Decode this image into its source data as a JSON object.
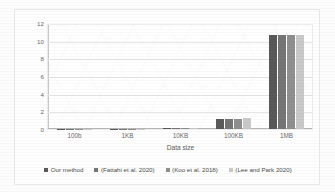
{
  "chart_data": {
    "type": "bar",
    "title": "",
    "xlabel": "Data size",
    "ylabel": "Computation time (ms)",
    "ylim": [
      0,
      12
    ],
    "yticks": [
      0,
      2,
      4,
      6,
      8,
      10,
      12
    ],
    "ytick_labels": [
      "0",
      "2",
      "4",
      "6",
      "8",
      "10",
      "12"
    ],
    "grid": "horizontal",
    "legend_position": "bottom",
    "categories": [
      "100b",
      "1KB",
      "10KB",
      "100KB",
      "1MB"
    ],
    "series": [
      {
        "name": "Our method",
        "color": "#595959",
        "values": [
          0.02,
          0.03,
          0.12,
          1.12,
          10.7
        ]
      },
      {
        "name": "(Fattahi et al. 2020)",
        "color": "#757575",
        "values": [
          0.02,
          0.03,
          0.11,
          1.15,
          10.7
        ]
      },
      {
        "name": "(Koo et al. 2018)",
        "color": "#8f8f8f",
        "values": [
          0.02,
          0.03,
          0.13,
          1.18,
          10.7
        ]
      },
      {
        "name": "(Lee and Park 2020)",
        "color": "#c9c9c9",
        "values": [
          0.02,
          0.03,
          0.1,
          1.3,
          10.75
        ]
      }
    ]
  }
}
